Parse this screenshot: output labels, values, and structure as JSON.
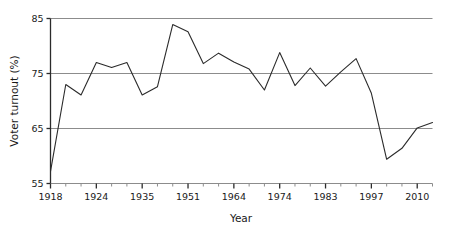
{
  "chart_data": {
    "type": "line",
    "title": "",
    "xlabel": "Year",
    "ylabel": "Voter turnout (%)",
    "ylim": [
      55,
      85
    ],
    "yticks": [
      55,
      65,
      75,
      85
    ],
    "ytick_labels": [
      "55",
      "65",
      "75",
      "85"
    ],
    "grid": "horizontal",
    "legend": "none",
    "x_labeled_ticks": [
      "1918",
      "1924",
      "1935",
      "1951",
      "1964",
      "1974",
      "1983",
      "1997",
      "2010"
    ],
    "x_labeled_indices": [
      0,
      3,
      6,
      9,
      12,
      15,
      18,
      21,
      24
    ],
    "categories": [
      "1918",
      "1922",
      "1923",
      "1924",
      "1929",
      "1931",
      "1935",
      "1945",
      "1950",
      "1951",
      "1955",
      "1959",
      "1964",
      "1966",
      "1970",
      "1974",
      "1974b",
      "1979",
      "1983",
      "1987",
      "1992",
      "1997",
      "2001",
      "2005",
      "2010",
      "2015"
    ],
    "values": [
      57.2,
      73.0,
      71.1,
      77.0,
      76.1,
      77.0,
      71.1,
      72.6,
      83.9,
      82.6,
      76.8,
      78.7,
      77.1,
      75.8,
      72.0,
      78.8,
      72.8,
      76.0,
      72.7,
      75.3,
      77.7,
      71.4,
      59.4,
      61.4,
      65.1,
      66.1
    ],
    "line_color": "#2b2b2b",
    "grid_color": "#8c8c8c",
    "axis_color": "#2b2b2b",
    "background": "#ffffff"
  },
  "axes": {
    "y_label": "Voter turnout (%)",
    "x_label": "Year"
  }
}
